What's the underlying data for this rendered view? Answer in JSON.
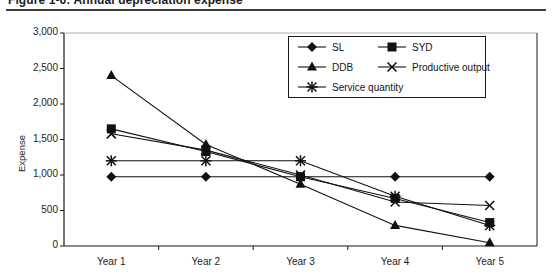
{
  "figure": {
    "title": "Figure 1-6: Annual depreciation expense"
  },
  "chart_data": {
    "type": "line",
    "title": "Annual depreciation expense",
    "xlabel": "",
    "ylabel": "Expense",
    "categories": [
      "Year 1",
      "Year 2",
      "Year 3",
      "Year 4",
      "Year 5"
    ],
    "ylim": [
      0,
      3000
    ],
    "ytick_labels": [
      "0",
      "500",
      "1,000",
      "1,500",
      "2,000",
      "2,500",
      "3,000"
    ],
    "ytick_values": [
      0,
      500,
      1000,
      1500,
      2000,
      2500,
      3000
    ],
    "grid": false,
    "legend_position": "top-right",
    "series": [
      {
        "name": "SL",
        "marker": "diamond",
        "values": [
          975,
          975,
          975,
          975,
          975
        ]
      },
      {
        "name": "SYD",
        "marker": "square",
        "values": [
          1650,
          1330,
          975,
          670,
          330
        ]
      },
      {
        "name": "DDB",
        "marker": "triangle",
        "values": [
          2400,
          1430,
          870,
          290,
          45
        ]
      },
      {
        "name": "Productive output",
        "marker": "x",
        "values": [
          1580,
          1350,
          1000,
          620,
          570
        ]
      },
      {
        "name": "Service quantity",
        "marker": "asterisk",
        "values": [
          1200,
          1200,
          1200,
          700,
          290
        ]
      }
    ]
  },
  "legend": {
    "items": [
      {
        "label": "SL"
      },
      {
        "label": "SYD"
      },
      {
        "label": "DDB"
      },
      {
        "label": "Productive output"
      },
      {
        "label": "Service quantity"
      }
    ]
  }
}
